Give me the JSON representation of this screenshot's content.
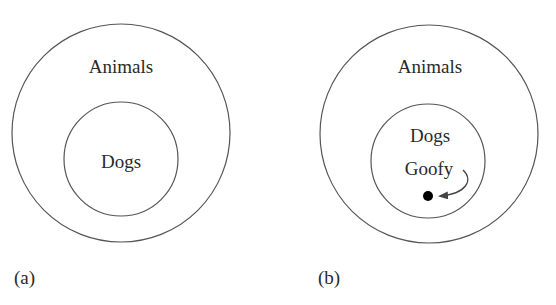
{
  "diagram": {
    "panels": [
      {
        "id": "a",
        "caption": "(a)",
        "outer_set": "Animals",
        "inner_set": "Dogs"
      },
      {
        "id": "b",
        "caption": "(b)",
        "outer_set": "Animals",
        "inner_set": "Dogs",
        "element": "Goofy"
      }
    ],
    "colors": {
      "stroke": "#555555",
      "text": "#2a2a2a",
      "dot": "#000000"
    }
  }
}
